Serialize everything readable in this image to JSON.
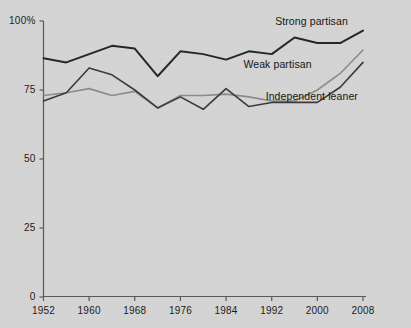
{
  "chart_data": {
    "type": "line",
    "title": "",
    "xlabel": "",
    "ylabel": "",
    "xlim": [
      1952,
      2008
    ],
    "ylim": [
      0,
      100
    ],
    "grid": false,
    "legend_position": "inline-annotations",
    "x": [
      1952,
      1956,
      1960,
      1964,
      1968,
      1972,
      1976,
      1980,
      1984,
      1988,
      1992,
      1996,
      2000,
      2004,
      2008
    ],
    "x_tick_labels": [
      "1952",
      "1960",
      "1968",
      "1976",
      "1984",
      "1992",
      "2000",
      "2008"
    ],
    "x_ticks": [
      1952,
      1960,
      1968,
      1976,
      1984,
      1992,
      2000,
      2008
    ],
    "y_ticks": [
      0,
      25,
      50,
      75,
      100
    ],
    "y_tick_labels": [
      "0",
      "25",
      "50",
      "75",
      "100%"
    ],
    "series": [
      {
        "name": "Strong partisan",
        "color": "#262626",
        "width": 2.0,
        "values": [
          86.5,
          85.0,
          88.0,
          91.0,
          90.0,
          80.0,
          89.0,
          88.0,
          86.0,
          89.0,
          88.0,
          94.0,
          92.0,
          92.0,
          96.5
        ]
      },
      {
        "name": "Weak partisan",
        "color": "#8c8c8c",
        "width": 1.6,
        "values": [
          73.0,
          74.0,
          75.5,
          73.0,
          74.5,
          68.5,
          73.0,
          73.0,
          73.5,
          72.5,
          71.0,
          71.0,
          75.0,
          81.0,
          89.5
        ]
      },
      {
        "name": "Independent leaner",
        "color": "#3a3a3a",
        "width": 1.6,
        "values": [
          71.0,
          74.0,
          83.0,
          80.5,
          75.0,
          68.5,
          72.5,
          68.0,
          75.5,
          69.0,
          70.5,
          70.5,
          70.5,
          76.0,
          85.0
        ]
      }
    ],
    "annotations": [
      {
        "text": "Strong partisan",
        "x": 1999,
        "y": 99.5
      },
      {
        "text": "Weak partisan",
        "x": 1993,
        "y": 84.0
      },
      {
        "text": "Independent leaner",
        "x": 1999,
        "y": 72.5
      }
    ]
  },
  "axis": {
    "y_labels": [
      "100%",
      "75",
      "50",
      "25",
      "0"
    ],
    "x_labels": [
      "1952",
      "1960",
      "1968",
      "1976",
      "1984",
      "1992",
      "2000",
      "2008"
    ]
  }
}
